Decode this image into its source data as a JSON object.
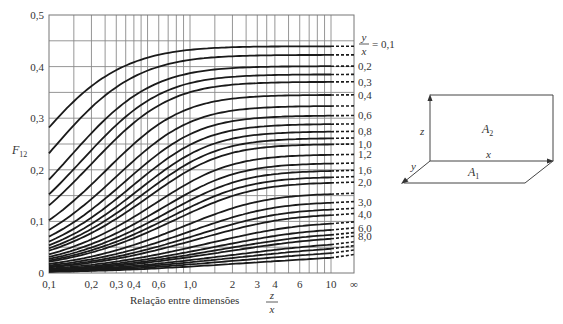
{
  "chart_data": {
    "type": "line",
    "title": "",
    "ylabel": "F12",
    "ylabel_main": "F",
    "ylabel_sub": "12",
    "xlabel": "Relação entre dimensões",
    "xlabel_fraction": {
      "num": "z",
      "den": "x"
    },
    "xscale": "log",
    "xlim": [
      0.1,
      "∞"
    ],
    "ylim": [
      0,
      0.5
    ],
    "grid": true,
    "x_tick_labels": [
      "0,1",
      "0,2",
      "0,3",
      "0,4",
      "0,6",
      "1,0",
      "2",
      "3",
      "4",
      "6",
      "10",
      "∞"
    ],
    "x_tick_values": [
      0.1,
      0.2,
      0.3,
      0.4,
      0.6,
      1.0,
      2,
      3,
      4,
      6,
      10,
      "inf"
    ],
    "y_tick_labels": [
      "0",
      "0,1",
      "0,2",
      "0,3",
      "0,4",
      "0,5"
    ],
    "y_tick_values": [
      0,
      0.1,
      0.2,
      0.3,
      0.4,
      0.5
    ],
    "parameter_label": {
      "num": "y",
      "den": "x",
      "suffix": "= 0,1"
    },
    "x": [
      0.1,
      0.2,
      0.5,
      1.0,
      2.0,
      5.0,
      10.0
    ],
    "series": [
      {
        "name": "0,1",
        "param": 0.1,
        "values": [
          0.285,
          0.36,
          0.41,
          0.43,
          0.44,
          0.445,
          0.445
        ],
        "end": 0.444
      },
      {
        "name": "0,2",
        "param": 0.2,
        "values": [
          0.18,
          0.27,
          0.35,
          0.38,
          0.395,
          0.4,
          0.4
        ],
        "end": 0.4
      },
      {
        "name": "0,3",
        "param": 0.3,
        "values": [
          0.125,
          0.21,
          0.3,
          0.34,
          0.36,
          0.37,
          0.375
        ],
        "end": 0.375
      },
      {
        "name": "0,4",
        "param": 0.4,
        "values": [
          0.1,
          0.17,
          0.26,
          0.3,
          0.33,
          0.345,
          0.348
        ],
        "end": 0.348
      },
      {
        "name": "0,6",
        "param": 0.6,
        "values": [
          0.07,
          0.12,
          0.2,
          0.25,
          0.285,
          0.305,
          0.31
        ],
        "end": 0.31
      },
      {
        "name": "0,8",
        "param": 0.8,
        "values": [
          0.055,
          0.095,
          0.165,
          0.21,
          0.25,
          0.275,
          0.28
        ],
        "end": 0.281
      },
      {
        "name": "1,0",
        "param": 1.0,
        "values": [
          0.045,
          0.08,
          0.14,
          0.2,
          0.23,
          0.245,
          0.25
        ],
        "end": 0.25
      },
      {
        "name": "1,2",
        "param": 1.2,
        "values": [
          0.04,
          0.07,
          0.12,
          0.17,
          0.21,
          0.225,
          0.229
        ],
        "end": 0.229
      },
      {
        "name": "1,6",
        "param": 1.6,
        "values": [
          0.03,
          0.055,
          0.1,
          0.14,
          0.18,
          0.195,
          0.2
        ],
        "end": 0.2
      },
      {
        "name": "2,0",
        "param": 2.0,
        "values": [
          0.025,
          0.045,
          0.085,
          0.12,
          0.155,
          0.17,
          0.176
        ],
        "end": 0.176
      },
      {
        "name": "3,0",
        "param": 3.0,
        "values": [
          0.017,
          0.032,
          0.062,
          0.09,
          0.12,
          0.133,
          0.138
        ],
        "end": 0.138
      },
      {
        "name": "4,0",
        "param": 4.0,
        "values": [
          0.013,
          0.025,
          0.05,
          0.07,
          0.095,
          0.106,
          0.11
        ],
        "end": 0.11
      },
      {
        "name": "6,0",
        "param": 6.0,
        "values": [
          0.009,
          0.017,
          0.034,
          0.05,
          0.068,
          0.077,
          0.081
        ],
        "end": 0.081
      },
      {
        "name": "8,0",
        "param": 8.0,
        "values": [
          0.007,
          0.013,
          0.026,
          0.038,
          0.053,
          0.06,
          0.064
        ],
        "end": 0.064
      }
    ],
    "unlabeled_series_params": [
      0.14,
      0.25,
      0.5,
      0.7,
      0.9,
      1.4,
      1.8,
      2.5,
      3.5,
      5.0,
      7.0,
      10.0,
      12.0,
      15.0,
      20.0
    ],
    "legend_position": "right"
  },
  "diagram": {
    "label_A1": "A",
    "label_A1_sub": "1",
    "label_A2": "A",
    "label_A2_sub": "2",
    "label_x": "x",
    "label_y": "y",
    "label_z": "z"
  }
}
